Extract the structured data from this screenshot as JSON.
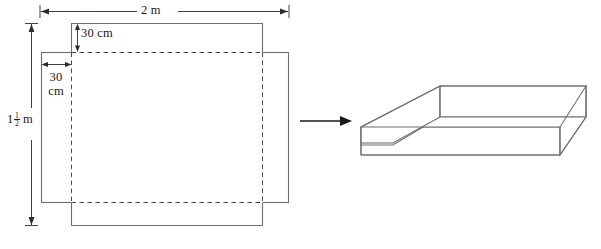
{
  "figure": {
    "colors": {
      "line": "#6e6e6e",
      "dimension_line": "#2b2b2b",
      "text": "#1a1a1a",
      "background": "#ffffff"
    },
    "left_diagram": {
      "name": "cardboard-net",
      "description": "Rectangular sheet with 30 cm squares cut from each corner, shown as overlapping rectangles with a dashed fold rectangle",
      "labels": {
        "width": "2 m",
        "top_cut": "30 cm",
        "side_cut_value": "30",
        "side_cut_unit": "cm",
        "height_whole": "1",
        "height_numerator": "1",
        "height_denominator": "2",
        "height_unit": "m"
      }
    },
    "arrow": {
      "name": "transform-arrow",
      "direction": "right"
    },
    "right_diagram": {
      "name": "open-box",
      "description": "Three dimensional open-topped rectangular tray drawn in oblique projection"
    }
  }
}
